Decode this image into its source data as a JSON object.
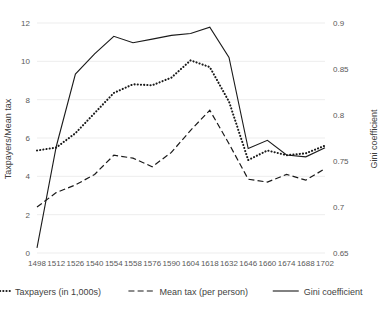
{
  "chart_data": {
    "type": "line",
    "title": "",
    "xlabel": "",
    "ylabel": "Taxpayers/Mean tax",
    "y2label": "Gini coefficient",
    "grid": true,
    "legend_position": "bottom",
    "categories": [
      "1498",
      "1512",
      "1526",
      "1540",
      "1554",
      "1558",
      "1576",
      "1590",
      "1604",
      "1618",
      "1632",
      "1646",
      "1660",
      "1674",
      "1688",
      "1702"
    ],
    "x_tick_labels": [
      "1498",
      "1512",
      "1526",
      "1540",
      "1554",
      "1558",
      "1576",
      "1590",
      "1604",
      "1618",
      "1632",
      "1646",
      "1660",
      "1674",
      "1688",
      "1702"
    ],
    "y_tick_labels": [
      "0",
      "2",
      "4",
      "6",
      "8",
      "10",
      "12"
    ],
    "y_ticks": [
      0,
      2,
      4,
      6,
      8,
      10,
      12
    ],
    "ylim": [
      0,
      12
    ],
    "y2_tick_labels": [
      "0.65",
      "0.7",
      "0.75",
      "0.8",
      "0.85",
      "0.9"
    ],
    "y2_ticks": [
      0.65,
      0.7,
      0.75,
      0.8,
      0.85,
      0.9
    ],
    "y2lim": [
      0.65,
      0.9
    ],
    "series": [
      {
        "name": "Taxpayers (in 1,000s)",
        "style": "dotted",
        "axis": "left",
        "color": "#1a1a1a",
        "values": [
          5.35,
          5.5,
          6.25,
          7.3,
          8.35,
          8.8,
          8.75,
          9.15,
          10.05,
          9.7,
          7.9,
          4.85,
          5.35,
          5.1,
          5.2,
          5.6
        ]
      },
      {
        "name": "Mean tax (per person)",
        "style": "dashed",
        "axis": "left",
        "color": "#1a1a1a",
        "values": [
          2.4,
          3.15,
          3.55,
          4.1,
          5.1,
          4.95,
          4.5,
          5.25,
          6.4,
          7.45,
          5.7,
          3.85,
          3.7,
          4.1,
          3.8,
          4.4
        ]
      },
      {
        "name": "Gini coefficient",
        "style": "solid",
        "axis": "right",
        "color": "#1a1a1a",
        "values": [
          0.6555,
          0.7655,
          0.8445,
          0.8665,
          0.8855,
          0.8785,
          0.8825,
          0.8865,
          0.8885,
          0.8955,
          0.8625,
          0.7635,
          0.7725,
          0.7565,
          0.7545,
          0.7645
        ]
      }
    ]
  },
  "legend": {
    "items": [
      {
        "label": "Taxpayers (in 1,000s)",
        "style": "dotted"
      },
      {
        "label": "Mean tax (per person)",
        "style": "dashed"
      },
      {
        "label": "Gini coefficient",
        "style": "solid"
      }
    ]
  },
  "axes": {
    "left_title": "Taxpayers/Mean tax",
    "right_title": "Gini coefficient"
  }
}
